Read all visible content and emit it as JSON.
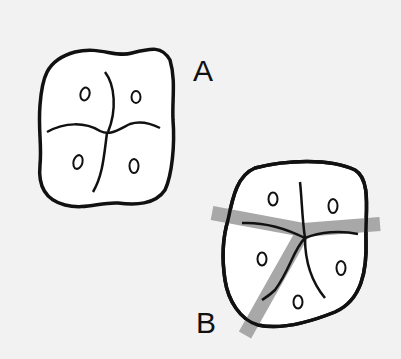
{
  "diagram": {
    "type": "tooth occlusal outline comparison",
    "figures": [
      {
        "id": "A",
        "label": "A",
        "description": "Square-shaped occlusal outline with four cusp marks and cross-shaped central grooves"
      },
      {
        "id": "B",
        "label": "B",
        "description": "Rounded occlusal outline with five cusp marks, Y-shaped groove pattern highlighted with gray bands"
      }
    ],
    "colors": {
      "background": "#f2f2f2",
      "outline": "#111111",
      "fill": "#ffffff",
      "highlight_band": "#a8a8a8"
    }
  }
}
